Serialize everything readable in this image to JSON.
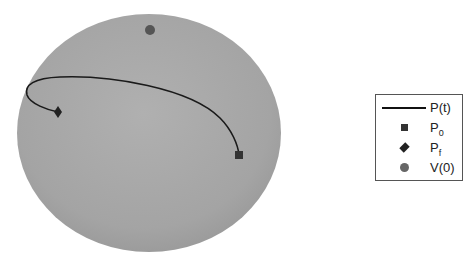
{
  "figure": {
    "type": "sphere-trajectory",
    "sphere_color": "#a8a8a8",
    "curve_color": "#1a1a1a",
    "marker_color": "#333333",
    "v0_color": "#555555"
  },
  "legend": {
    "items": [
      {
        "symbol": "line",
        "label": "P(t)",
        "base": "P(t)",
        "sub": ""
      },
      {
        "symbol": "square",
        "label": "P0",
        "base": "P",
        "sub": "0"
      },
      {
        "symbol": "diamond",
        "label": "Pf",
        "base": "P",
        "sub": "f"
      },
      {
        "symbol": "circle",
        "label": "V(0)",
        "base": "V(0)",
        "sub": ""
      }
    ]
  },
  "points": {
    "P0": {
      "x": 239,
      "y": 155
    },
    "Pf": {
      "x": 58,
      "y": 112
    },
    "V0": {
      "x": 150,
      "y": 30
    }
  }
}
